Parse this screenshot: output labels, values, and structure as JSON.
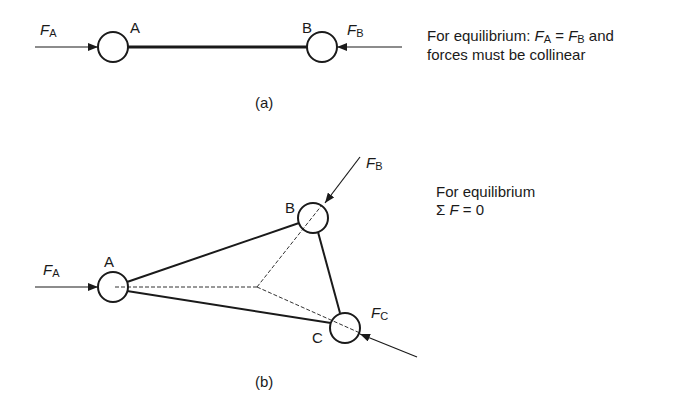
{
  "diagram_a": {
    "caption": "(a)",
    "nodes": [
      {
        "id": "A",
        "label": "A"
      },
      {
        "id": "B",
        "label": "B"
      }
    ],
    "forces": [
      {
        "symbol": "F",
        "sub": "A"
      },
      {
        "symbol": "F",
        "sub": "B"
      }
    ],
    "note_line1_prefix": "For equilibrium: ",
    "note_line1_eq": " = ",
    "note_line1_suffix": " and",
    "note_line2": "forces must be collinear"
  },
  "diagram_b": {
    "caption": "(b)",
    "nodes": [
      {
        "id": "A",
        "label": "A"
      },
      {
        "id": "B",
        "label": "B"
      },
      {
        "id": "C",
        "label": "C"
      }
    ],
    "forces": [
      {
        "symbol": "F",
        "sub": "A"
      },
      {
        "symbol": "F",
        "sub": "B"
      },
      {
        "symbol": "F",
        "sub": "C"
      }
    ],
    "note_line1": "For equilibrium",
    "note_line2_sigma": "Σ",
    "note_line2_f": "F",
    "note_line2_rest": " = 0"
  }
}
